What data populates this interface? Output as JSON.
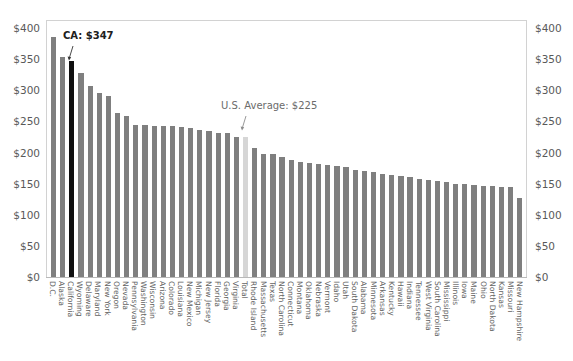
{
  "chart_data": {
    "type": "bar",
    "title": "",
    "subtitle": "",
    "xlabel": "",
    "ylabel": "",
    "ylim": [
      0,
      400
    ],
    "ytick_values": [
      0,
      50,
      100,
      150,
      200,
      250,
      300,
      350,
      400
    ],
    "ytick_labels": [
      "$0",
      "$50",
      "$100",
      "$150",
      "$200",
      "$250",
      "$300",
      "$350",
      "$400"
    ],
    "left_axis_labels": [
      "$400",
      "$350",
      "$300",
      "$250",
      "$200",
      "$150",
      "$100",
      "$50",
      "$0"
    ],
    "right_axis_labels": [
      "$400",
      "$350",
      "$300",
      "$250",
      "$200",
      "$150",
      "$100",
      "$50",
      "$0"
    ],
    "grid": false,
    "legend": "none",
    "bar_color": "#7f7f7f",
    "highlight_color": "#101010",
    "average_color": "#d6d6d6",
    "categories": [
      "D.C.",
      "Alaska",
      "California",
      "Wyoming",
      "Delaware",
      "Maryland",
      "New York",
      "Oregon",
      "Nevada",
      "Pennsylvania",
      "Washington",
      "Wisconsin",
      "Arizona",
      "Colorado",
      "Louisiana",
      "New Mexico",
      "Michigan",
      "New Jersey",
      "Florida",
      "Georgia",
      "Virginia",
      "Total",
      "Rhode Island",
      "Massachusetts",
      "Texas",
      "North Carolina",
      "Connecticut",
      "Montana",
      "Oklahoma",
      "Nebraska",
      "Vermont",
      "Idaho",
      "Utah",
      "South Dakota",
      "Alabama",
      "Minnesota",
      "Arkansas",
      "Kentucky",
      "Hawaii",
      "Indiana",
      "Tennessee",
      "West Virginia",
      "South Carolina",
      "Mississippi",
      "Illinois",
      "Iowa",
      "Maine",
      "Ohio",
      "North Dakota",
      "Kansas",
      "Missouri",
      "New Hampshire"
    ],
    "values": [
      385,
      353,
      347,
      327,
      307,
      295,
      290,
      264,
      258,
      244,
      244,
      243,
      242,
      242,
      241,
      239,
      236,
      234,
      232,
      232,
      225,
      225,
      208,
      198,
      197,
      193,
      188,
      185,
      183,
      181,
      180,
      178,
      176,
      172,
      170,
      168,
      166,
      164,
      162,
      160,
      158,
      156,
      154,
      152,
      150,
      149,
      148,
      147,
      146,
      145,
      144,
      127
    ],
    "highlight_category": "California",
    "average_category": "Total",
    "annotations": [
      {
        "id": "ca",
        "text": "CA: $347",
        "category": "California",
        "value": 347
      },
      {
        "id": "average",
        "text": "U.S. Average: $225",
        "category": "Total",
        "value": 225
      }
    ]
  },
  "annotation_ca_label": "CA: $347",
  "annotation_average_label": "U.S. Average: $225"
}
